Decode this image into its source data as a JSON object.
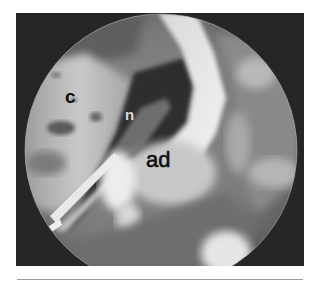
{
  "figure": {
    "type": "endoscopic-photograph",
    "colormode": "grayscale",
    "labels": [
      {
        "id": "c",
        "text": "c"
      },
      {
        "id": "n",
        "text": "n"
      },
      {
        "id": "ad",
        "text": "ad"
      }
    ]
  },
  "colors": {
    "background": "#ffffff",
    "frame_dark": "#262626",
    "rule": "#9a9a9a",
    "label_dark": "#111111",
    "label_light": "#dcdcdc"
  }
}
